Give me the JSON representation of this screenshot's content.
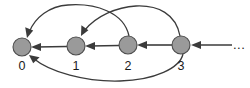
{
  "figure": {
    "title": "",
    "ellipsis_label": "...",
    "colors": {
      "node_fill": "#9a9a9a",
      "node_stroke": "#4d4d4d",
      "edge": "#3b3b3b",
      "label": "#1a1a1a",
      "background": "#ffffff"
    }
  },
  "nodes": [
    {
      "id": "0",
      "label": "0",
      "cx": 22,
      "cy": 47,
      "r": 9
    },
    {
      "id": "1",
      "label": "1",
      "cx": 76,
      "cy": 46,
      "r": 9
    },
    {
      "id": "2",
      "label": "2",
      "cx": 128,
      "cy": 45,
      "r": 9
    },
    {
      "id": "3",
      "label": "3",
      "cx": 181,
      "cy": 45,
      "r": 9
    }
  ],
  "edges": [
    {
      "id": "e-1-0",
      "from": "1",
      "to": "0",
      "shape": "straight",
      "label": ""
    },
    {
      "id": "e-2-1",
      "from": "2",
      "to": "1",
      "shape": "straight",
      "label": ""
    },
    {
      "id": "e-3-2",
      "from": "3",
      "to": "2",
      "shape": "straight",
      "label": ""
    },
    {
      "id": "e-ellipsis-3",
      "from": "...",
      "to": "3",
      "shape": "straight",
      "label": ""
    },
    {
      "id": "e-2-0",
      "from": "2",
      "to": "0",
      "shape": "arc-above",
      "label": ""
    },
    {
      "id": "e-3-1",
      "from": "3",
      "to": "1",
      "shape": "arc-above",
      "label": ""
    },
    {
      "id": "e-3-0",
      "from": "3",
      "to": "0",
      "shape": "arc-below",
      "label": ""
    }
  ]
}
